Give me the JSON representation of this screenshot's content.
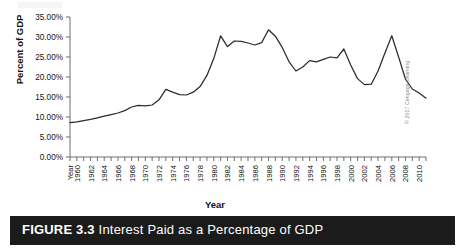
{
  "figure": {
    "caption_number": "FIGURE 3.3",
    "caption_title": "Interest Paid as a Percentage of GDP",
    "credit": "© 2017 Cengage Learning"
  },
  "chart_data": {
    "type": "line",
    "title": "Interest Paid as a Percentage of GDP",
    "xlabel": "Year",
    "ylabel": "Percent of GDP",
    "ylim": [
      0,
      35
    ],
    "ytick_labels": [
      "35.00%",
      "30.00%",
      "25.00%",
      "20.00%",
      "15.00%",
      "10.00%",
      "5.00%",
      "0.00%"
    ],
    "ytick_values": [
      35,
      30,
      25,
      20,
      15,
      10,
      5,
      0
    ],
    "xtick_first_label": "Year",
    "xtick_labels": [
      "1960",
      "1962",
      "1964",
      "1966",
      "1968",
      "1970",
      "1972",
      "1974",
      "1976",
      "1978",
      "1980",
      "1982",
      "1984",
      "1986",
      "1988",
      "1990",
      "1992",
      "1994",
      "1996",
      "1998",
      "2000",
      "2002",
      "2004",
      "2006",
      "2008",
      "2010"
    ],
    "xlim": [
      1959,
      2011
    ],
    "grid": false,
    "legend": "none",
    "x": [
      1959,
      1960,
      1961,
      1962,
      1963,
      1964,
      1965,
      1966,
      1967,
      1968,
      1969,
      1970,
      1971,
      1972,
      1973,
      1974,
      1975,
      1976,
      1977,
      1978,
      1979,
      1980,
      1981,
      1982,
      1983,
      1984,
      1985,
      1986,
      1987,
      1988,
      1989,
      1990,
      1991,
      1992,
      1993,
      1994,
      1995,
      1996,
      1997,
      1998,
      1999,
      2000,
      2001,
      2002,
      2003,
      2004,
      2005,
      2006,
      2007,
      2008,
      2009,
      2010,
      2011
    ],
    "values": [
      8.6,
      8.8,
      9.1,
      9.4,
      9.8,
      10.2,
      10.6,
      11.0,
      11.6,
      12.5,
      12.9,
      12.8,
      13.0,
      14.3,
      16.9,
      16.2,
      15.6,
      15.5,
      16.2,
      17.6,
      20.4,
      24.6,
      30.3,
      27.6,
      29.0,
      28.9,
      28.5,
      28.0,
      28.6,
      31.8,
      30.2,
      27.4,
      23.8,
      21.5,
      22.5,
      24.1,
      23.8,
      24.4,
      25.0,
      24.8,
      27.0,
      23.0,
      19.6,
      18.1,
      18.2,
      21.5,
      26.0,
      30.3,
      25.0,
      19.5,
      17.0,
      16.0,
      14.7
    ],
    "units": "percent"
  }
}
